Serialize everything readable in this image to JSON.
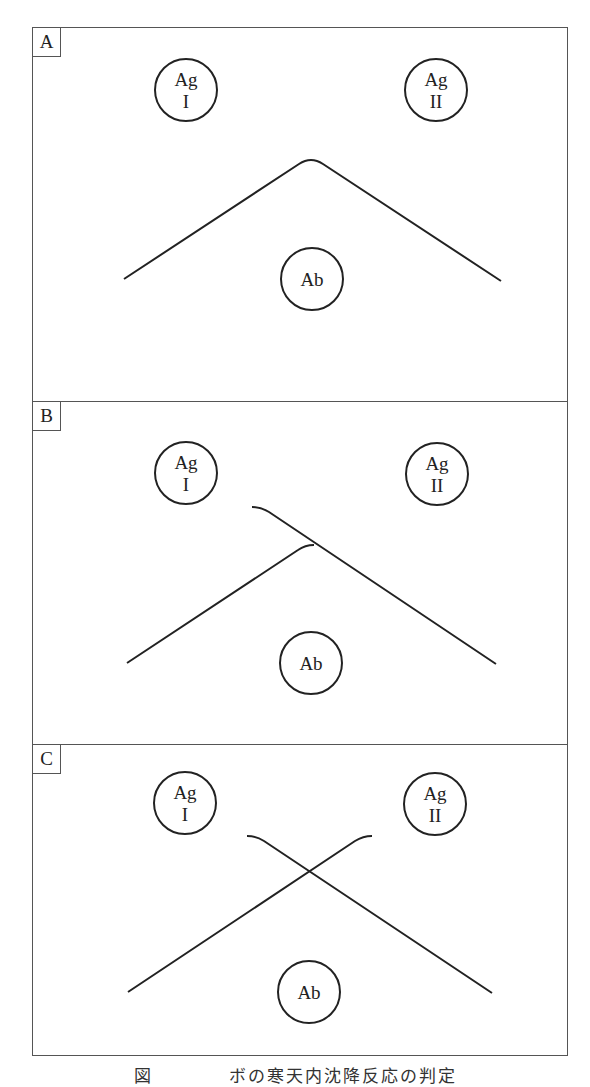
{
  "figure": {
    "stroke_color": "#222222",
    "border_color": "#555555",
    "panels": [
      {
        "label": "A",
        "top": 0,
        "height": 373,
        "wells": {
          "ag1": {
            "line1": "Ag",
            "line2": "I",
            "cx": 153,
            "cy": 62
          },
          "ag2": {
            "line1": "Ag",
            "line2": "II",
            "cx": 403,
            "cy": 62
          },
          "ab": {
            "label": "Ab",
            "cx": 279,
            "cy": 251
          }
        },
        "precipitin_pattern": "identity (fused arcs)"
      },
      {
        "label": "B",
        "top": 373,
        "height": 343,
        "wells": {
          "ag1": {
            "line1": "Ag",
            "line2": "I",
            "cx": 153,
            "cy": 71
          },
          "ag2": {
            "line1": "Ag",
            "line2": "II",
            "cx": 404,
            "cy": 72
          },
          "ab": {
            "label": "Ab",
            "cx": 278,
            "cy": 261
          }
        },
        "precipitin_pattern": "partial identity (spur)"
      },
      {
        "label": "C",
        "top": 716,
        "height": 313,
        "wells": {
          "ag1": {
            "line1": "Ag",
            "line2": "I",
            "cx": 152,
            "cy": 58
          },
          "ag2": {
            "line1": "Ag",
            "line2": "II",
            "cx": 402,
            "cy": 59
          },
          "ab": {
            "label": "Ab",
            "cx": 276,
            "cy": 247
          }
        },
        "precipitin_pattern": "non-identity (crossing lines)"
      }
    ]
  },
  "caption": "図　　　　ボの寒天内沈降反応の判定"
}
